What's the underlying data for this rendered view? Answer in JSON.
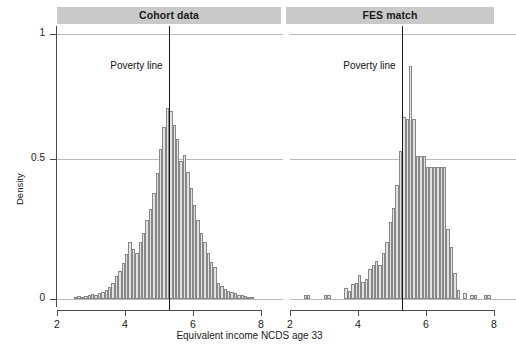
{
  "figure": {
    "width": 499,
    "height": 346,
    "background": "#ffffff",
    "strip_color": "#c9c9c9",
    "bar_fill": "#e2e2e2",
    "bar_stroke": "#888888",
    "grid_color": "#b9b9b9",
    "axis_color": "#4a4a4a"
  },
  "axis": {
    "xlabel": "Equivalent income NCDS age 33",
    "ylabel": "Density",
    "y_ticks": [
      "0",
      "0.5",
      "1"
    ],
    "x_ticks": [
      "2",
      "4",
      "6",
      "8"
    ]
  },
  "annotations": {
    "poverty_label_left": "Poverty line",
    "poverty_label_right": "Poverty line"
  },
  "chart_data": {
    "type": "bar",
    "title": "",
    "subtitle": "",
    "xlabel": "Equivalent income NCDS age 33",
    "ylabel": "Density",
    "xlim": [
      2,
      8
    ],
    "ylim": [
      0,
      1.05
    ],
    "y_ticks": [
      0,
      0.5,
      1
    ],
    "x_ticks": [
      2,
      4,
      6,
      8
    ],
    "grid": true,
    "legend_position": "none",
    "bin_width": 0.1,
    "panels": [
      {
        "name": "Cohort data",
        "poverty_line_x": 5.28,
        "poverty_label": "Poverty line",
        "bins": [
          {
            "x": 2.55,
            "density": 0.008
          },
          {
            "x": 2.65,
            "density": 0.01
          },
          {
            "x": 2.75,
            "density": 0.009
          },
          {
            "x": 2.85,
            "density": 0.012
          },
          {
            "x": 2.95,
            "density": 0.014
          },
          {
            "x": 3.05,
            "density": 0.018
          },
          {
            "x": 3.15,
            "density": 0.016
          },
          {
            "x": 3.25,
            "density": 0.022
          },
          {
            "x": 3.35,
            "density": 0.028
          },
          {
            "x": 3.45,
            "density": 0.035
          },
          {
            "x": 3.55,
            "density": 0.045
          },
          {
            "x": 3.65,
            "density": 0.06
          },
          {
            "x": 3.75,
            "density": 0.085
          },
          {
            "x": 3.85,
            "density": 0.105
          },
          {
            "x": 3.95,
            "density": 0.135
          },
          {
            "x": 4.05,
            "density": 0.17
          },
          {
            "x": 4.15,
            "density": 0.215
          },
          {
            "x": 4.25,
            "density": 0.19
          },
          {
            "x": 4.35,
            "density": 0.175
          },
          {
            "x": 4.45,
            "density": 0.215
          },
          {
            "x": 4.55,
            "density": 0.25
          },
          {
            "x": 4.65,
            "density": 0.3
          },
          {
            "x": 4.75,
            "density": 0.34
          },
          {
            "x": 4.85,
            "density": 0.4
          },
          {
            "x": 4.95,
            "density": 0.475
          },
          {
            "x": 5.05,
            "density": 0.565
          },
          {
            "x": 5.15,
            "density": 0.65
          },
          {
            "x": 5.25,
            "density": 0.72
          },
          {
            "x": 5.35,
            "density": 0.71
          },
          {
            "x": 5.45,
            "density": 0.655
          },
          {
            "x": 5.55,
            "density": 0.605
          },
          {
            "x": 5.65,
            "density": 0.52
          },
          {
            "x": 5.75,
            "density": 0.545
          },
          {
            "x": 5.85,
            "density": 0.48
          },
          {
            "x": 5.95,
            "density": 0.42
          },
          {
            "x": 6.05,
            "density": 0.355
          },
          {
            "x": 6.15,
            "density": 0.3
          },
          {
            "x": 6.25,
            "density": 0.25
          },
          {
            "x": 6.35,
            "density": 0.215
          },
          {
            "x": 6.45,
            "density": 0.175
          },
          {
            "x": 6.55,
            "density": 0.14
          },
          {
            "x": 6.65,
            "density": 0.12
          },
          {
            "x": 6.75,
            "density": 0.06
          },
          {
            "x": 6.85,
            "density": 0.048
          },
          {
            "x": 6.95,
            "density": 0.038
          },
          {
            "x": 7.05,
            "density": 0.032
          },
          {
            "x": 7.15,
            "density": 0.026
          },
          {
            "x": 7.25,
            "density": 0.022
          },
          {
            "x": 7.35,
            "density": 0.016
          },
          {
            "x": 7.45,
            "density": 0.014
          },
          {
            "x": 7.55,
            "density": 0.01
          },
          {
            "x": 7.65,
            "density": 0.008
          },
          {
            "x": 7.75,
            "density": 0.006
          }
        ]
      },
      {
        "name": "FES match",
        "poverty_line_x": 5.28,
        "poverty_label": "Poverty line",
        "bins": [
          {
            "x": 2.45,
            "density": 0.015
          },
          {
            "x": 2.55,
            "density": 0.015
          },
          {
            "x": 3.05,
            "density": 0.015
          },
          {
            "x": 3.15,
            "density": 0.015
          },
          {
            "x": 3.65,
            "density": 0.04
          },
          {
            "x": 3.75,
            "density": 0.03
          },
          {
            "x": 3.85,
            "density": 0.055
          },
          {
            "x": 3.95,
            "density": 0.06
          },
          {
            "x": 4.05,
            "density": 0.09
          },
          {
            "x": 4.15,
            "density": 0.065
          },
          {
            "x": 4.25,
            "density": 0.075
          },
          {
            "x": 4.35,
            "density": 0.115
          },
          {
            "x": 4.45,
            "density": 0.13
          },
          {
            "x": 4.55,
            "density": 0.145
          },
          {
            "x": 4.65,
            "density": 0.13
          },
          {
            "x": 4.75,
            "density": 0.175
          },
          {
            "x": 4.85,
            "density": 0.215
          },
          {
            "x": 4.95,
            "density": 0.29
          },
          {
            "x": 5.05,
            "density": 0.345
          },
          {
            "x": 5.15,
            "density": 0.43
          },
          {
            "x": 5.25,
            "density": 0.56
          },
          {
            "x": 5.35,
            "density": 0.685
          },
          {
            "x": 5.45,
            "density": 0.68
          },
          {
            "x": 5.55,
            "density": 0.88
          },
          {
            "x": 5.65,
            "density": 0.68
          },
          {
            "x": 5.75,
            "density": 0.54
          },
          {
            "x": 5.85,
            "density": 0.54
          },
          {
            "x": 5.95,
            "density": 0.54
          },
          {
            "x": 6.05,
            "density": 0.5
          },
          {
            "x": 6.15,
            "density": 0.5
          },
          {
            "x": 6.25,
            "density": 0.5
          },
          {
            "x": 6.35,
            "density": 0.5
          },
          {
            "x": 6.45,
            "density": 0.5
          },
          {
            "x": 6.55,
            "density": 0.5
          },
          {
            "x": 6.65,
            "density": 0.265
          },
          {
            "x": 6.75,
            "density": 0.195
          },
          {
            "x": 6.85,
            "density": 0.1
          },
          {
            "x": 6.95,
            "density": 0.035
          },
          {
            "x": 7.15,
            "density": 0.022
          },
          {
            "x": 7.35,
            "density": 0.016
          },
          {
            "x": 7.45,
            "density": 0.016
          },
          {
            "x": 7.75,
            "density": 0.014
          },
          {
            "x": 7.85,
            "density": 0.014
          }
        ]
      }
    ]
  }
}
